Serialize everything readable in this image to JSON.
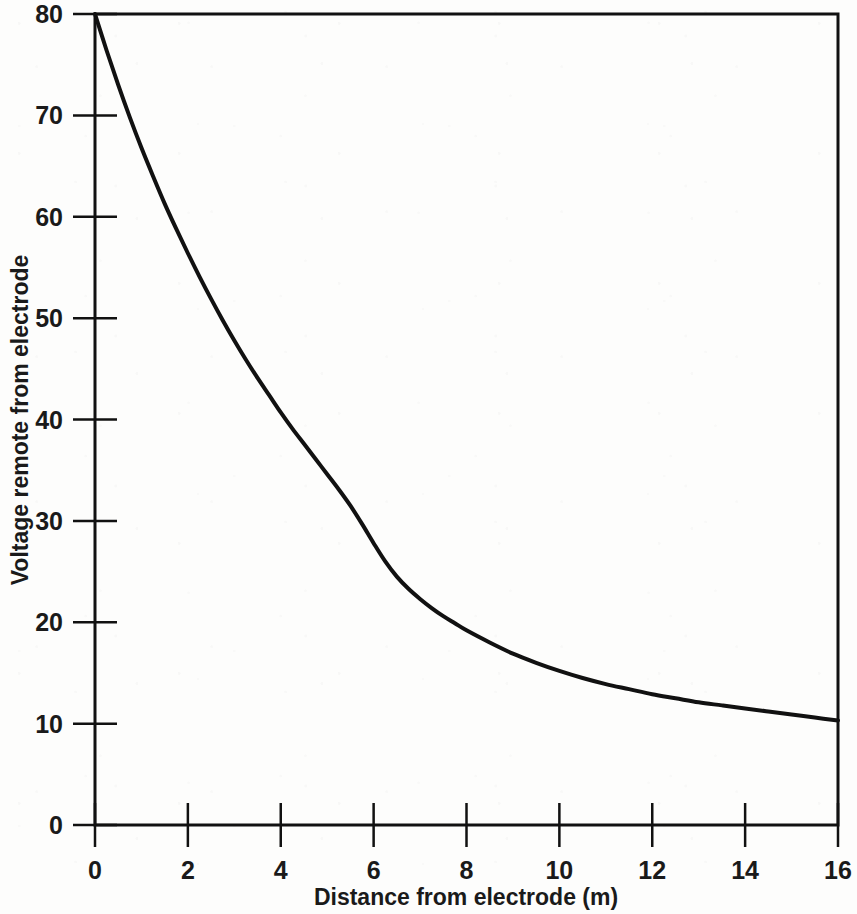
{
  "chart_data": {
    "type": "line",
    "title": "",
    "subtitle": "",
    "xlabel": "Distance from electrode (m)",
    "ylabel": "Voltage remote from electrode",
    "xlim": [
      0,
      16
    ],
    "ylim": [
      0,
      80
    ],
    "xticks": [
      0,
      2,
      4,
      6,
      8,
      10,
      12,
      14,
      16
    ],
    "yticks": [
      0,
      10,
      20,
      30,
      40,
      50,
      60,
      70,
      80
    ],
    "xtick_labels": [
      "0",
      "2",
      "4",
      "6",
      "8",
      "10",
      "12",
      "14",
      "16"
    ],
    "ytick_labels": [
      "0",
      "10",
      "20",
      "30",
      "40",
      "50",
      "60",
      "70",
      "80"
    ],
    "grid": false,
    "legend": null,
    "legend_position": "none",
    "line_color": "#111111",
    "line_width": 4,
    "frame": "box",
    "annotations": [],
    "series": [
      {
        "name": "Voltage remote from electrode",
        "x": [
          0.0,
          0.25,
          0.5,
          0.75,
          1.0,
          1.25,
          1.5,
          1.75,
          2.0,
          2.25,
          2.5,
          2.75,
          3.0,
          3.25,
          3.5,
          3.75,
          4.0,
          4.25,
          4.5,
          4.75,
          5.0,
          5.25,
          5.5,
          5.75,
          6.0,
          6.25,
          6.5,
          6.75,
          7.0,
          7.25,
          7.5,
          7.75,
          8.0,
          8.5,
          9.0,
          9.5,
          10.0,
          10.5,
          11.0,
          11.5,
          12.0,
          12.5,
          13.0,
          13.5,
          14.0,
          14.5,
          15.0,
          15.5,
          16.0
        ],
        "y": [
          80.0,
          76.4,
          73.0,
          69.8,
          66.8,
          64.0,
          61.3,
          58.8,
          56.4,
          54.1,
          51.9,
          49.8,
          47.8,
          45.9,
          44.1,
          42.4,
          40.7,
          39.1,
          37.6,
          36.1,
          34.6,
          33.1,
          31.5,
          29.7,
          27.8,
          26.0,
          24.5,
          23.3,
          22.3,
          21.4,
          20.6,
          19.9,
          19.2,
          18.0,
          16.9,
          16.0,
          15.2,
          14.5,
          13.9,
          13.4,
          12.9,
          12.5,
          12.1,
          11.8,
          11.5,
          11.2,
          10.9,
          10.6,
          10.3
        ]
      }
    ]
  },
  "axes": {
    "x_title": "Distance from electrode (m)",
    "y_title": "Voltage remote from electrode"
  }
}
